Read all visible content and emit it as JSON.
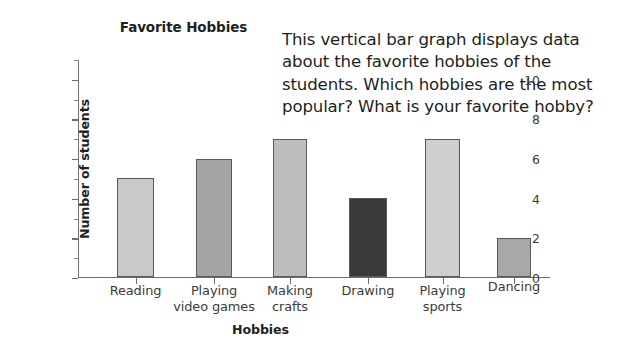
{
  "chart_data": {
    "type": "bar",
    "title": "Favorite Hobbies",
    "xlabel": "Hobbies",
    "ylabel": "Number of students",
    "categories": [
      "Reading",
      "Playing video games",
      "Making crafts",
      "Drawing",
      "Playing sports",
      "Dancing"
    ],
    "values": [
      5,
      6,
      7,
      4,
      7,
      2
    ],
    "bar_colors": [
      "#c9c9c9",
      "#a5a5a5",
      "#bdbdbd",
      "#3a3a3a",
      "#cfcfcf",
      "#a8a8a8"
    ],
    "ylim": [
      0,
      11
    ],
    "ytick_labels": [
      "0",
      "2",
      "4",
      "6",
      "8",
      "10"
    ],
    "ytick_values": [
      0,
      2,
      4,
      6,
      8,
      10
    ],
    "yminor_values": [
      1,
      3,
      5,
      7,
      9,
      11
    ],
    "grid": false,
    "legend": false
  },
  "description": {
    "text": "This vertical bar graph displays data about the favorite hobbies of the students. Which hobbies are the most popular? What is your favorite hobby?"
  },
  "colors": {
    "axis": "#6e6e6e",
    "text": "#231f20",
    "bar_outline": "#595959",
    "background": "#ffffff"
  }
}
